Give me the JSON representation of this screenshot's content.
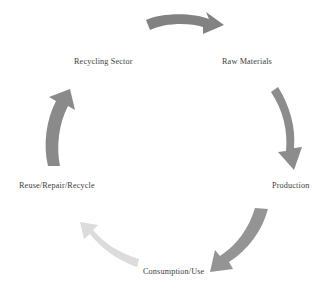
{
  "diagram": {
    "type": "circular-cycle",
    "title": "",
    "background_color": "#ffffff",
    "direction": "clockwise",
    "stages": [
      {
        "id": "raw-materials",
        "label": "Raw Materials",
        "position": "top-right"
      },
      {
        "id": "production",
        "label": "Production",
        "position": "right"
      },
      {
        "id": "consumption-use",
        "label": "Consumption/Use",
        "position": "bottom"
      },
      {
        "id": "reuse-repair-recycle",
        "label": "Reuse/Repair/Recycle",
        "position": "left"
      },
      {
        "id": "recycling-sector",
        "label": "Recycling Sector",
        "position": "top-left"
      }
    ],
    "arrows": [
      {
        "id": "arrow-top",
        "from": "recycling-sector",
        "to": "raw-materials",
        "color": "#828282",
        "direction": "right"
      },
      {
        "id": "arrow-right",
        "from": "raw-materials",
        "to": "production",
        "color": "#8c8c8c",
        "direction": "down"
      },
      {
        "id": "arrow-bottom-right",
        "from": "production",
        "to": "consumption-use",
        "color": "#949494",
        "direction": "down-left"
      },
      {
        "id": "arrow-bottom-left",
        "from": "consumption-use",
        "to": "reuse-repair-recycle",
        "color": "#dcdcdc",
        "direction": "up-left"
      },
      {
        "id": "arrow-left",
        "from": "reuse-repair-recycle",
        "to": "recycling-sector",
        "color": "#8a8a8a",
        "direction": "up-right"
      }
    ],
    "text_color": "#3d3d3d"
  }
}
